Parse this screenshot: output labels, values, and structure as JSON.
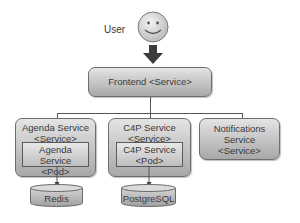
{
  "diagram": {
    "user": {
      "label": "User",
      "icon": "smiley-face-icon"
    },
    "frontend": {
      "label": "Frontend <Service>"
    },
    "services": [
      {
        "title_line1": "Agenda Service",
        "title_line2": "<Service>",
        "pod_line1": "Agenda Service",
        "pod_line2": "<Pod>",
        "datastore": "Redis"
      },
      {
        "title_line1": "C4P Service",
        "title_line2": "<Service>",
        "pod_line1": "C4P Service",
        "pod_line2": "<Pod>",
        "datastore": "PostgreSQL"
      },
      {
        "title_line1": "Notifications",
        "title_line2": "Service",
        "title_line3": "<Service>"
      }
    ],
    "colors": {
      "box_top": "#e4e4e4",
      "box_bottom": "#a8a8a8",
      "line": "#555555",
      "face": "#d8d8d8"
    }
  }
}
